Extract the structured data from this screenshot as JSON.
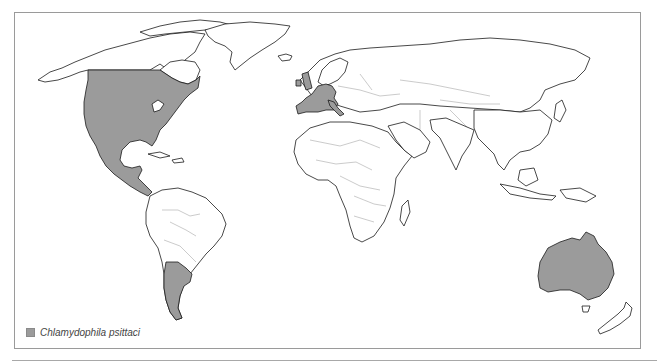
{
  "figure": {
    "type": "world-distribution-map",
    "legend": {
      "items": [
        {
          "label": "Chlamydophila psittaci",
          "swatch_color": "#9b9b9b"
        }
      ]
    },
    "colors": {
      "shaded_region": "#9b9b9b",
      "land": "#ffffff",
      "coastline": "#1a1a1a",
      "country_border": "#b5b5b5",
      "frame": "#9a9a9a"
    },
    "shaded_regions": [
      "United States",
      "Southern Canada",
      "Mexico",
      "Central America",
      "United Kingdom",
      "Ireland",
      "France",
      "Spain",
      "Portugal",
      "Italy",
      "Germany",
      "Benelux",
      "Switzerland",
      "Argentina",
      "Australia"
    ]
  }
}
